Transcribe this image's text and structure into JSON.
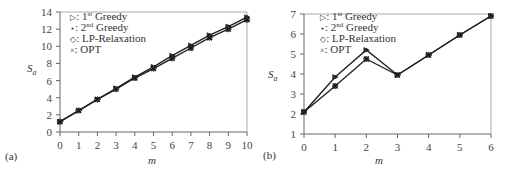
{
  "chart_data": [
    {
      "panel": "(a)",
      "type": "line",
      "xlabel": "m",
      "ylabel": "S_a",
      "xlim": [
        0,
        10
      ],
      "ylim": [
        0,
        14
      ],
      "xticks": [
        0,
        1,
        2,
        3,
        4,
        5,
        6,
        7,
        8,
        9,
        10
      ],
      "yticks": [
        0,
        2,
        4,
        6,
        8,
        10,
        12,
        14
      ],
      "grid": false,
      "legend_position": "upper left",
      "x": [
        0,
        1,
        2,
        3,
        4,
        5,
        6,
        7,
        8,
        9,
        10
      ],
      "series": [
        {
          "name": "1st Greedy",
          "marker": "triangle-right",
          "values": [
            1.2,
            2.5,
            3.8,
            5.1,
            6.4,
            7.6,
            8.9,
            10.1,
            11.3,
            12.3,
            13.4
          ]
        },
        {
          "name": "2nd Greedy",
          "marker": "star",
          "values": [
            1.2,
            2.5,
            3.8,
            5.1,
            6.4,
            7.6,
            8.9,
            10.1,
            11.3,
            12.3,
            13.4
          ]
        },
        {
          "name": "LP-Relaxation",
          "marker": "diamond",
          "values": [
            1.2,
            2.5,
            3.8,
            5.0,
            6.3,
            7.4,
            8.6,
            9.8,
            11.0,
            12.0,
            13.1
          ]
        },
        {
          "name": "OPT",
          "marker": "x",
          "values": [
            1.2,
            2.5,
            3.8,
            5.0,
            6.3,
            7.4,
            8.6,
            9.8,
            11.0,
            12.0,
            13.1
          ]
        }
      ]
    },
    {
      "panel": "(b)",
      "type": "line",
      "xlabel": "m",
      "ylabel": "S_a",
      "xlim": [
        0,
        6
      ],
      "ylim": [
        1,
        7
      ],
      "xticks": [
        0,
        1,
        2,
        3,
        4,
        5,
        6
      ],
      "yticks": [
        1,
        2,
        3,
        4,
        5,
        6,
        7
      ],
      "grid": false,
      "legend_position": "upper left",
      "x": [
        0,
        1,
        2,
        3,
        4,
        5,
        6
      ],
      "series": [
        {
          "name": "1st Greedy",
          "marker": "triangle-right",
          "values": [
            2.1,
            3.85,
            5.2,
            3.95,
            4.95,
            5.95,
            6.9
          ]
        },
        {
          "name": "2nd Greedy",
          "marker": "star",
          "values": [
            2.1,
            3.85,
            5.2,
            3.95,
            4.95,
            5.95,
            6.9
          ]
        },
        {
          "name": "LP-Relaxation",
          "marker": "diamond",
          "values": [
            2.1,
            3.4,
            4.75,
            3.95,
            4.95,
            5.95,
            6.9
          ]
        },
        {
          "name": "OPT",
          "marker": "x",
          "values": [
            2.1,
            3.4,
            4.75,
            3.95,
            4.95,
            5.95,
            6.9
          ]
        }
      ]
    }
  ],
  "legend": {
    "items": [
      {
        "symbol": "▷",
        "sep": ": ",
        "pre": "1",
        "sup": "st",
        "post": " Greedy"
      },
      {
        "symbol": "⋆",
        "sep": ": ",
        "pre": "2",
        "sup": "nd",
        "post": " Greedy"
      },
      {
        "symbol": "◇",
        "sep": ": ",
        "pre": "LP-Relaxation",
        "sup": "",
        "post": ""
      },
      {
        "symbol": "×",
        "sep": ": ",
        "pre": "OPT",
        "sup": "",
        "post": ""
      }
    ]
  },
  "labels": {
    "a": {
      "panel": "(a)",
      "xlabel": "m",
      "ylabel_main": "S",
      "ylabel_sub": "a"
    },
    "b": {
      "panel": "(b)",
      "xlabel": "m",
      "ylabel_main": "S",
      "ylabel_sub": "a"
    }
  }
}
